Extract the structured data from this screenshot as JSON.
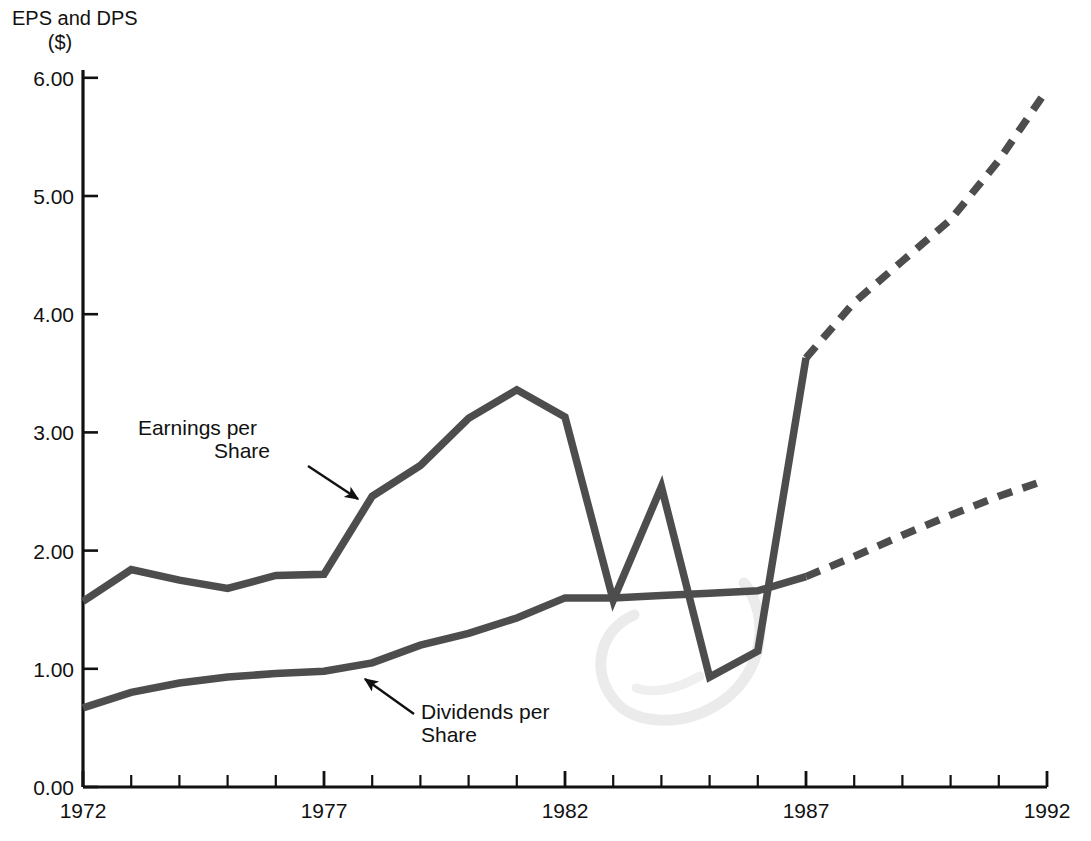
{
  "chart_data": {
    "type": "line",
    "title": "",
    "ylabel_line1": "EPS and DPS",
    "ylabel_line2": "($)",
    "xlabel": "",
    "x": [
      1972,
      1973,
      1974,
      1975,
      1976,
      1977,
      1978,
      1979,
      1980,
      1981,
      1982,
      1983,
      1984,
      1985,
      1986,
      1987,
      1988,
      1989,
      1990,
      1991,
      1992
    ],
    "xlim": [
      1972,
      1992
    ],
    "ylim": [
      0.0,
      6.0
    ],
    "xtick_labels": [
      "1972",
      "1977",
      "1982",
      "1987",
      "1992"
    ],
    "xticks": [
      1972,
      1977,
      1982,
      1987,
      1992
    ],
    "ytick_labels": [
      "0.00",
      "1.00",
      "2.00",
      "3.00",
      "4.00",
      "5.00",
      "6.00"
    ],
    "yticks": [
      0.0,
      1.0,
      2.0,
      3.0,
      4.0,
      5.0,
      6.0
    ],
    "grid": false,
    "legend": "none",
    "minor_xticks_every_year": true,
    "series": [
      {
        "name": "Earnings per Share",
        "color": "#4d4d4d",
        "actual_x": [
          1972,
          1973,
          1974,
          1975,
          1976,
          1977,
          1978,
          1979,
          1980,
          1981,
          1982,
          1983,
          1984,
          1985,
          1986,
          1987
        ],
        "actual_values": [
          1.57,
          1.84,
          1.75,
          1.68,
          1.79,
          1.8,
          2.46,
          2.72,
          3.12,
          3.36,
          3.13,
          1.58,
          2.54,
          0.93,
          1.15,
          3.63
        ],
        "forecast_x": [
          1987,
          1988,
          1989,
          1990,
          1991,
          1992
        ],
        "forecast_values": [
          3.63,
          4.1,
          4.45,
          4.8,
          5.3,
          5.9
        ],
        "style_actual": "solid",
        "style_forecast": "dashed"
      },
      {
        "name": "Dividends per Share",
        "color": "#4d4d4d",
        "actual_x": [
          1972,
          1973,
          1974,
          1975,
          1976,
          1977,
          1978,
          1979,
          1980,
          1981,
          1982,
          1983,
          1984,
          1985,
          1986,
          1987
        ],
        "actual_values": [
          0.67,
          0.8,
          0.88,
          0.93,
          0.96,
          0.98,
          1.05,
          1.2,
          1.3,
          1.43,
          1.6,
          1.6,
          1.62,
          1.64,
          1.66,
          1.78
        ],
        "forecast_x": [
          1987,
          1988,
          1989,
          1990,
          1991,
          1992
        ],
        "forecast_values": [
          1.78,
          1.95,
          2.13,
          2.3,
          2.46,
          2.6
        ],
        "style_actual": "solid",
        "style_forecast": "dashed"
      }
    ],
    "annotations": [
      {
        "id": "eps-annotation",
        "text_line1": "Earnings per",
        "text_line2": "Share",
        "text_x": 257,
        "text_y1": 435,
        "text_y2": 458,
        "arrow_from_x": 308,
        "arrow_from_y": 466,
        "arrow_to_x": 358,
        "arrow_to_y": 499
      },
      {
        "id": "dps-annotation",
        "text_line1": "Dividends per",
        "text_line2": "Share",
        "text_x": 421,
        "text_y1": 719,
        "text_y2": 742,
        "arrow_from_x": 414,
        "arrow_from_y": 714,
        "arrow_to_x": 365,
        "arrow_to_y": 679
      }
    ],
    "artifact": {
      "description": "faint light-gray scanned pen swirl",
      "color": "#dedede"
    }
  }
}
